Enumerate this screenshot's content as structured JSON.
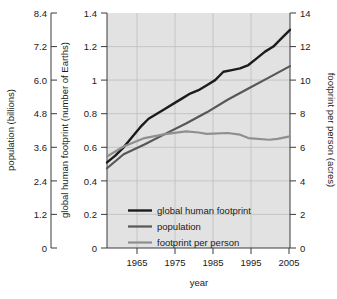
{
  "chart_data": {
    "type": "line",
    "title": "",
    "xlabel": "year",
    "x_ticks": [
      1965,
      1975,
      1985,
      1995,
      2005
    ],
    "xlim": [
      1961,
      2005
    ],
    "grid": true,
    "legend_position": "inside-bottom-center",
    "axes": {
      "left": {
        "label": "population (billions)",
        "ticks": [
          "8.4",
          "7.2",
          "6.0",
          "4.8",
          "3.6",
          "2.4",
          "1.2",
          "0"
        ],
        "lim": [
          0,
          8.4
        ]
      },
      "inner_left": {
        "label": "global human footprint (number of Earths)",
        "ticks": [
          "1.4",
          "1.2",
          "1",
          "0.8",
          "0.6",
          "0.4",
          "0.2",
          "0"
        ],
        "lim": [
          0,
          1.4
        ]
      },
      "right": {
        "label": "footprint per person (acres)",
        "ticks": [
          "14",
          "12",
          "10",
          "8",
          "6",
          "4",
          "2",
          "0"
        ],
        "lim": [
          0,
          14
        ]
      }
    },
    "series": [
      {
        "name": "global human footprint",
        "unit": "number of Earths",
        "axis": "inner_left",
        "color": "#1c1c1c",
        "x": [
          1961,
          1963,
          1965,
          1967,
          1969,
          1971,
          1973,
          1975,
          1977,
          1979,
          1981,
          1983,
          1985,
          1987,
          1989,
          1991,
          1993,
          1995,
          1997,
          1999,
          2001,
          2003,
          2005
        ],
        "values": [
          0.51,
          0.55,
          0.6,
          0.66,
          0.72,
          0.77,
          0.8,
          0.83,
          0.86,
          0.89,
          0.92,
          0.94,
          0.97,
          1.0,
          1.05,
          1.06,
          1.07,
          1.09,
          1.13,
          1.17,
          1.2,
          1.25,
          1.3
        ]
      },
      {
        "name": "population",
        "unit": "billions",
        "axis": "left",
        "color": "#575757",
        "x": [
          1961,
          1965,
          1970,
          1975,
          1980,
          1985,
          1990,
          1995,
          2000,
          2005
        ],
        "values": [
          2.85,
          3.35,
          3.7,
          4.08,
          4.45,
          4.85,
          5.3,
          5.7,
          6.1,
          6.5
        ]
      },
      {
        "name": "footprint per person",
        "unit": "acres",
        "axis": "right",
        "color": "#8f8f8f",
        "x": [
          1961,
          1965,
          1970,
          1975,
          1980,
          1983,
          1985,
          1990,
          1993,
          1995,
          2000,
          2002,
          2005
        ],
        "values": [
          5.45,
          6.05,
          6.55,
          6.78,
          6.95,
          6.88,
          6.8,
          6.85,
          6.75,
          6.55,
          6.45,
          6.5,
          6.65
        ]
      }
    ]
  },
  "legend": {
    "items": [
      {
        "label": "global human footprint",
        "color": "#1c1c1c"
      },
      {
        "label": "population",
        "color": "#575757"
      },
      {
        "label": "footprint per person",
        "color": "#8f8f8f"
      }
    ]
  }
}
